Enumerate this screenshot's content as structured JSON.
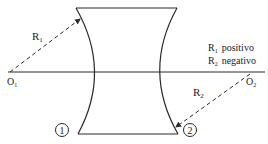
{
  "diagram": {
    "type": "biconcave-lens",
    "labels": {
      "r1": "R",
      "r1_sub": "1",
      "r2": "R",
      "r2_sub": "2",
      "o1": "O",
      "o1_sub": "1",
      "o2": "O",
      "o2_sub": "2",
      "surface1": "1",
      "surface2": "2"
    },
    "legend": {
      "line1_main": "R",
      "line1_sub": "1",
      "line1_text": "positivo",
      "line2_main": "R",
      "line2_sub": "2",
      "line2_text": "negativo"
    },
    "colors": {
      "stroke": "#2a2a2a",
      "background": "#ffffff"
    }
  }
}
